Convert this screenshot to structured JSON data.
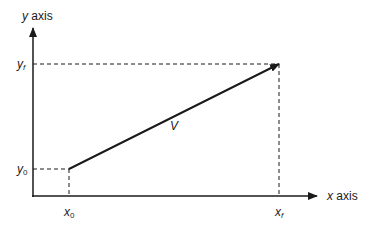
{
  "diagram": {
    "axes": {
      "y_label_var": "y",
      "y_label_word": "axis",
      "x_label_var": "x",
      "x_label_word": "axis"
    },
    "points": {
      "y0_var": "y",
      "y0_sub": "0",
      "yf_var": "y",
      "yf_sub": "f",
      "x0_var": "x",
      "x0_sub": "0",
      "xf_var": "x",
      "xf_sub": "f"
    },
    "vector": {
      "label": "V",
      "start": [
        69,
        169
      ],
      "end": [
        279,
        64
      ]
    },
    "colors": {
      "line": "#1a1a1a",
      "background": "#ffffff"
    }
  }
}
